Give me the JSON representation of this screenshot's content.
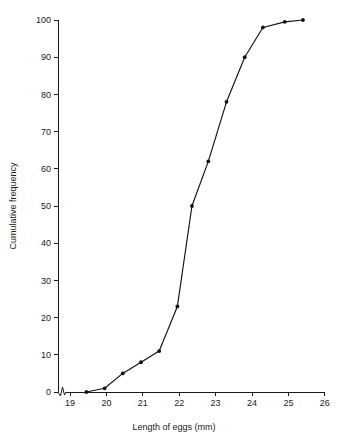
{
  "chart_data": {
    "type": "line",
    "title": "",
    "xlabel": "Length of eggs (mm)",
    "ylabel": "Cumulative frequency",
    "xlim": [
      18.6,
      26
    ],
    "ylim": [
      0,
      100
    ],
    "xticks": [
      19,
      20,
      21,
      22,
      23,
      24,
      25,
      26
    ],
    "xtick_labels": [
      "19",
      "20",
      "21",
      "22",
      "23",
      "24",
      "25",
      "26"
    ],
    "yticks": [
      0,
      10,
      20,
      30,
      40,
      50,
      60,
      70,
      80,
      90,
      100
    ],
    "ytick_labels": [
      "0",
      "10",
      "20",
      "30",
      "40",
      "50",
      "60",
      "70",
      "80",
      "90",
      "100"
    ],
    "grid": false,
    "legend": false,
    "axis_break_x": true,
    "marker": "filled-circle",
    "line_color": "#111111",
    "marker_color": "#111111",
    "background_color": "#ffffff",
    "x": [
      19.45,
      19.95,
      20.45,
      20.95,
      21.45,
      21.95,
      22.35,
      22.8,
      23.3,
      23.8,
      24.3,
      24.9,
      25.4
    ],
    "values": [
      0,
      1,
      5,
      8,
      11,
      23,
      50,
      62,
      78,
      90,
      98,
      99.5,
      100
    ],
    "series": [
      {
        "name": "Cumulative frequency of egg lengths",
        "x": [
          19.45,
          19.95,
          20.45,
          20.95,
          21.45,
          21.95,
          22.35,
          22.8,
          23.3,
          23.8,
          24.3,
          24.9,
          25.4
        ],
        "values": [
          0,
          1,
          5,
          8,
          11,
          23,
          50,
          62,
          78,
          90,
          98,
          99.5,
          100
        ]
      }
    ]
  }
}
